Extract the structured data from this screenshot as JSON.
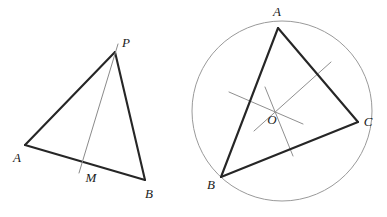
{
  "canvas": {
    "width": 387,
    "height": 217,
    "background": "#ffffff"
  },
  "style": {
    "triangle_stroke": "#262626",
    "construction_stroke": "#8f8f8f",
    "circle_stroke": "#9a9a9a",
    "label_color": "#1a1a1a"
  },
  "figures": [
    {
      "id": "left-figure",
      "name": "triangle-with-cevian",
      "caption": "",
      "points": {
        "P": {
          "label": "P",
          "x": 115,
          "y": 52,
          "label_x": 126,
          "label_y": 44
        },
        "A": {
          "label": "A",
          "x": 25,
          "y": 145,
          "label_x": 17,
          "label_y": 159
        },
        "B": {
          "label": "B",
          "x": 145,
          "y": 180,
          "label_x": 149,
          "label_y": 195
        },
        "M": {
          "label": "M",
          "x": 84,
          "y": 163,
          "label_x": 91,
          "label_y": 179
        }
      },
      "segments": [
        {
          "name": "side-AP",
          "from": "A",
          "to": "P",
          "kind": "triangle"
        },
        {
          "name": "side-PB",
          "from": "P",
          "to": "B",
          "kind": "triangle"
        },
        {
          "name": "side-AB",
          "from": "A",
          "to": "B",
          "kind": "triangle"
        }
      ],
      "construction_lines": [
        {
          "name": "cevian-PM",
          "x1": 118,
          "y1": 44,
          "x2": 79,
          "y2": 173,
          "kind": "cevian"
        }
      ]
    },
    {
      "id": "right-figure",
      "name": "triangle-inscribed-in-circumcircle",
      "caption": "",
      "points": {
        "A": {
          "label": "A",
          "x": 278,
          "y": 28,
          "label_x": 277,
          "label_y": 13
        },
        "B": {
          "label": "B",
          "x": 221,
          "y": 177,
          "label_x": 211,
          "label_y": 186
        },
        "C": {
          "label": "C",
          "x": 358,
          "y": 122,
          "label_x": 368,
          "label_y": 123
        },
        "O": {
          "label": "O",
          "x": 276,
          "y": 108,
          "label_x": 272,
          "label_y": 121
        }
      },
      "circle": {
        "name": "circumcircle",
        "cx": 282,
        "cy": 111,
        "r": 90
      },
      "segments": [
        {
          "name": "side-AB",
          "from": "A",
          "to": "B",
          "kind": "triangle"
        },
        {
          "name": "side-BC",
          "from": "B",
          "to": "C",
          "kind": "triangle"
        },
        {
          "name": "side-CA",
          "from": "C",
          "to": "A",
          "kind": "triangle"
        }
      ],
      "construction_lines": [
        {
          "name": "perpendicular-bisector-AC",
          "x1": 331,
          "y1": 62,
          "x2": 254,
          "y2": 131,
          "kind": "bisector"
        },
        {
          "name": "perpendicular-bisector-AB",
          "x1": 229,
          "y1": 92,
          "x2": 303,
          "y2": 124,
          "kind": "bisector"
        },
        {
          "name": "perpendicular-bisector-BC",
          "x1": 265,
          "y1": 87,
          "x2": 293,
          "y2": 156,
          "kind": "bisector"
        }
      ]
    }
  ]
}
